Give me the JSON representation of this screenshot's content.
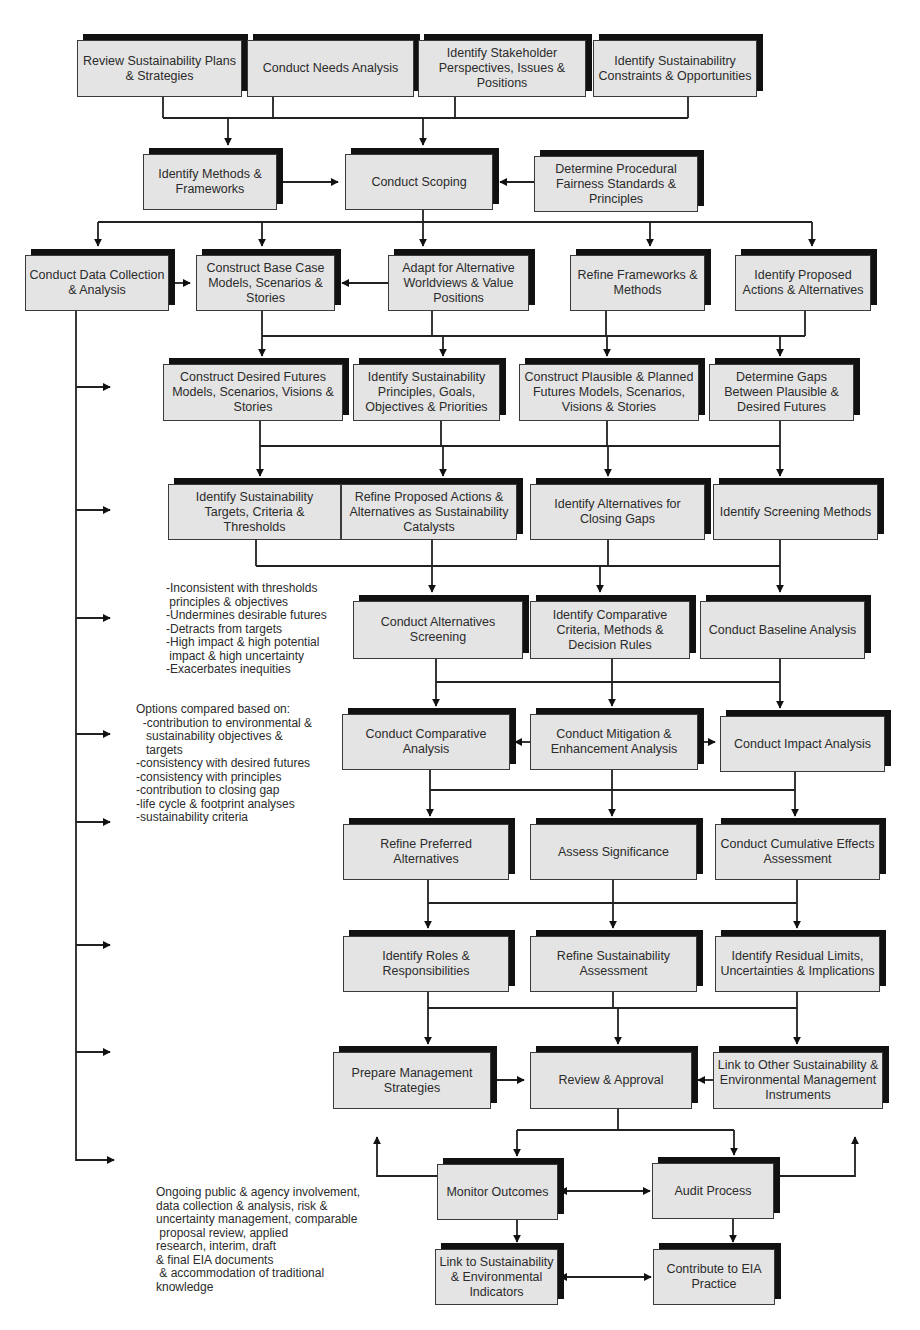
{
  "colors": {
    "box_fill": "#e4e4e4",
    "box_border": "#3a3a3a",
    "shadow": "#111111",
    "line": "#222222"
  },
  "boxes": [
    {
      "id": "b1",
      "label": "Review Sustainability Plans & Strategies",
      "x": 77,
      "y": 40,
      "w": 165,
      "h": 57
    },
    {
      "id": "b2",
      "label": "Conduct Needs Analysis",
      "x": 247,
      "y": 40,
      "w": 167,
      "h": 57
    },
    {
      "id": "b3",
      "label": "Identify Stakeholder Perspectives, Issues & Positions",
      "x": 418,
      "y": 40,
      "w": 168,
      "h": 57
    },
    {
      "id": "b4",
      "label": "Identify  Sustainabilitry Constraints & Opportunities",
      "x": 593,
      "y": 40,
      "w": 164,
      "h": 57
    },
    {
      "id": "b5",
      "label": "Identify Methods & Frameworks",
      "x": 143,
      "y": 154,
      "w": 134,
      "h": 56
    },
    {
      "id": "b6",
      "label": "Conduct Scoping",
      "x": 345,
      "y": 154,
      "w": 148,
      "h": 56
    },
    {
      "id": "b7",
      "label": "Determine Procedural Fairness Standards & Principles",
      "x": 534,
      "y": 156,
      "w": 164,
      "h": 56
    },
    {
      "id": "b8",
      "label": "Conduct Data Collection & Analysis",
      "x": 25,
      "y": 255,
      "w": 144,
      "h": 56
    },
    {
      "id": "b9",
      "label": "Construct Base Case Models, Scenarios & Stories",
      "x": 196,
      "y": 255,
      "w": 139,
      "h": 56
    },
    {
      "id": "b10",
      "label": "Adapt for Alternative Worldviews & Value Positions",
      "x": 388,
      "y": 255,
      "w": 141,
      "h": 56
    },
    {
      "id": "b11",
      "label": "Refine Frameworks & Methods",
      "x": 570,
      "y": 255,
      "w": 135,
      "h": 56
    },
    {
      "id": "b12",
      "label": "Identify Proposed Actions & Alternatives",
      "x": 735,
      "y": 255,
      "w": 136,
      "h": 56
    },
    {
      "id": "b13",
      "label": "Construct Desired Futures Models, Scenarios, Visions & Stories",
      "x": 163,
      "y": 364,
      "w": 180,
      "h": 57
    },
    {
      "id": "b14",
      "label": "Identify Sustainability Principles, Goals, Objectives & Priorities",
      "x": 353,
      "y": 364,
      "w": 147,
      "h": 57
    },
    {
      "id": "b15",
      "label": "Construct Plausible & Planned Futures Models, Scenarios, Visions & Stories",
      "x": 519,
      "y": 364,
      "w": 180,
      "h": 57
    },
    {
      "id": "b16",
      "label": "Determine Gaps Between Plausible & Desired Futures",
      "x": 709,
      "y": 364,
      "w": 145,
      "h": 57
    },
    {
      "id": "b17",
      "label": "Identify Sustainability Targets, Criteria & Thresholds",
      "x": 168,
      "y": 484,
      "w": 173,
      "h": 56
    },
    {
      "id": "b18",
      "label": "Refine Proposed Actions & Alternatives as Sustainability Catalysts",
      "x": 341,
      "y": 484,
      "w": 176,
      "h": 56
    },
    {
      "id": "b19",
      "label": "Identify Alternatives for Closing Gaps",
      "x": 530,
      "y": 484,
      "w": 175,
      "h": 56
    },
    {
      "id": "b20",
      "label": "Identify Screening Methods",
      "x": 713,
      "y": 484,
      "w": 165,
      "h": 56
    },
    {
      "id": "b21",
      "label": "Conduct Alternatives Screening",
      "x": 353,
      "y": 601,
      "w": 170,
      "h": 58
    },
    {
      "id": "b22",
      "label": "Identify Comparative Criteria, Methods & Decision Rules",
      "x": 530,
      "y": 601,
      "w": 160,
      "h": 58
    },
    {
      "id": "b23",
      "label": "Conduct Baseline Analysis",
      "x": 700,
      "y": 601,
      "w": 165,
      "h": 58
    },
    {
      "id": "b24",
      "label": "Conduct Comparative Analysis",
      "x": 342,
      "y": 714,
      "w": 168,
      "h": 56
    },
    {
      "id": "b25",
      "label": "Conduct Mitigation & Enhancement Analysis",
      "x": 530,
      "y": 714,
      "w": 168,
      "h": 56
    },
    {
      "id": "b26",
      "label": "Conduct Impact Analysis",
      "x": 720,
      "y": 716,
      "w": 165,
      "h": 56
    },
    {
      "id": "b27",
      "label": "Refine Preferred Alternatives",
      "x": 343,
      "y": 824,
      "w": 166,
      "h": 56
    },
    {
      "id": "b28",
      "label": "Assess Significance",
      "x": 530,
      "y": 824,
      "w": 167,
      "h": 56
    },
    {
      "id": "b29",
      "label": "Conduct Cumulative Effects Assessment",
      "x": 715,
      "y": 824,
      "w": 165,
      "h": 56
    },
    {
      "id": "b30",
      "label": "Identify Roles & Responsibilities",
      "x": 343,
      "y": 936,
      "w": 166,
      "h": 56
    },
    {
      "id": "b31",
      "label": "Refine Sustainability Assessment",
      "x": 530,
      "y": 936,
      "w": 167,
      "h": 56
    },
    {
      "id": "b32",
      "label": "Identify Residual Limits, Uncertainties & Implications",
      "x": 715,
      "y": 936,
      "w": 165,
      "h": 56
    },
    {
      "id": "b33",
      "label": "Prepare Management Strategies",
      "x": 333,
      "y": 1052,
      "w": 158,
      "h": 57
    },
    {
      "id": "b34",
      "label": "Review & Approval",
      "x": 530,
      "y": 1052,
      "w": 162,
      "h": 57
    },
    {
      "id": "b35",
      "label": "Link to Other Sustainability & Environmental Management Instruments",
      "x": 713,
      "y": 1052,
      "w": 170,
      "h": 57
    },
    {
      "id": "b36",
      "label": "Monitor Outcomes",
      "x": 437,
      "y": 1164,
      "w": 121,
      "h": 56
    },
    {
      "id": "b37",
      "label": "Audit Process",
      "x": 652,
      "y": 1163,
      "w": 122,
      "h": 56
    },
    {
      "id": "b38",
      "label": "Link to Sustainability & Environmental Indicators",
      "x": 435,
      "y": 1249,
      "w": 123,
      "h": 56
    },
    {
      "id": "b39",
      "label": "Contribute to EIA Practice",
      "x": 653,
      "y": 1249,
      "w": 122,
      "h": 56
    }
  ],
  "notes": [
    {
      "id": "screening-criteria",
      "x": 166,
      "y": 582,
      "text": "-Inconsistent with thresholds\n principles & objectives\n-Undermines desirable futures\n-Detracts from targets\n-High impact & high potential\n impact & high uncertainty\n-Exacerbates inequities"
    },
    {
      "id": "comparison-basis",
      "x": 136,
      "y": 703,
      "text": "Options compared based on:\n  -contribution to environmental &\n   sustainability objectives &\n   targets\n-consistency with desired futures\n-consistency with principles\n-contribution to closing gap\n-life cycle & footprint analyses\n-sustainability criteria"
    },
    {
      "id": "ongoing-activities",
      "x": 156,
      "y": 1186,
      "text": "Ongoing public & agency involvement,\ndata collection & analysis, risk &\nuncertainty management, comparable\n proposal review, applied\nresearch, interim, draft\n& final EIA documents\n & accommodation of traditional\nknowledge"
    }
  ]
}
